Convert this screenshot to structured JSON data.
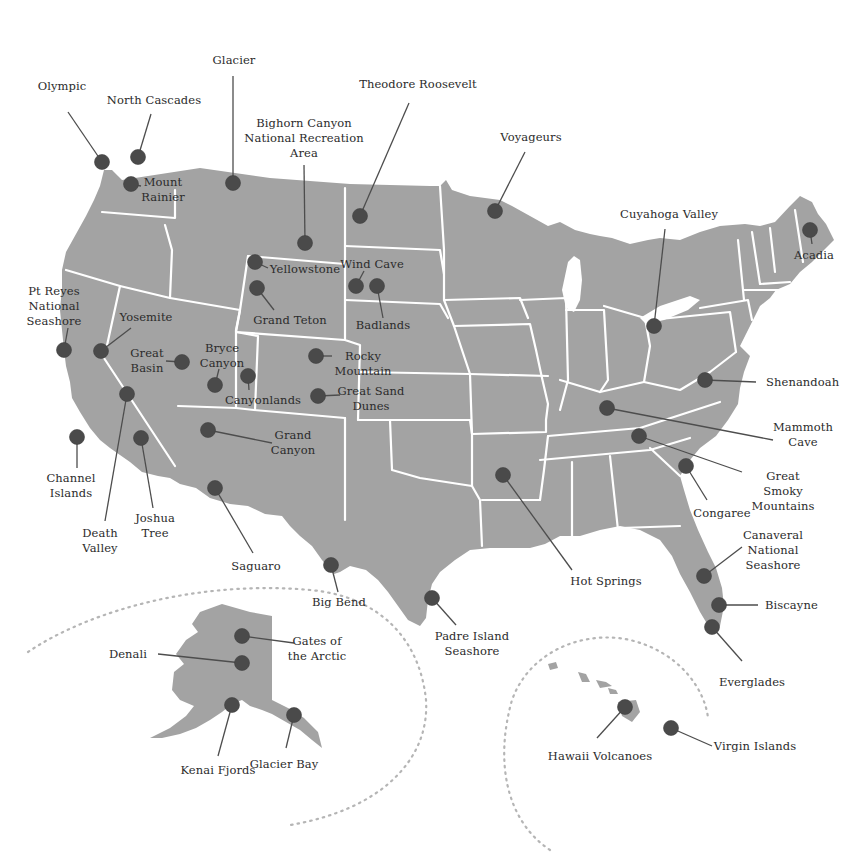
{
  "colors": {
    "land": "#a3a3a3",
    "border": "#ffffff",
    "marker": "#4a4a4a",
    "leader": "#4d4d4d",
    "text": "#2b2b2b",
    "inset_ring": "#b5b5b5"
  },
  "regions": {
    "contiguous_us": "Contiguous United States",
    "alaska_inset": "Alaska",
    "hawaii_inset": "Hawaii"
  },
  "parks": [
    {
      "id": "olympic",
      "name": "Olympic"
    },
    {
      "id": "north-cascades",
      "name": "North Cascades"
    },
    {
      "id": "mount-rainier",
      "name": "Mount\nRainier"
    },
    {
      "id": "glacier",
      "name": "Glacier"
    },
    {
      "id": "bighorn-canyon",
      "name": "Bighorn Canyon\nNational Recreation\nArea"
    },
    {
      "id": "theodore-roosevelt",
      "name": "Theodore Roosevelt"
    },
    {
      "id": "voyageurs",
      "name": "Voyageurs"
    },
    {
      "id": "cuyahoga-valley",
      "name": "Cuyahoga Valley"
    },
    {
      "id": "acadia",
      "name": "Acadia"
    },
    {
      "id": "yellowstone",
      "name": "Yellowstone"
    },
    {
      "id": "wind-cave",
      "name": "Wind Cave"
    },
    {
      "id": "badlands",
      "name": "Badlands"
    },
    {
      "id": "grand-teton",
      "name": "Grand Teton"
    },
    {
      "id": "pt-reyes",
      "name": "Pt Reyes\nNational\nSeashore"
    },
    {
      "id": "yosemite",
      "name": "Yosemite"
    },
    {
      "id": "great-basin",
      "name": "Great\nBasin"
    },
    {
      "id": "bryce-canyon",
      "name": "Bryce\nCanyon"
    },
    {
      "id": "canyonlands",
      "name": "Canyonlands"
    },
    {
      "id": "rocky-mountain",
      "name": "Rocky\nMountain"
    },
    {
      "id": "great-sand-dunes",
      "name": "Great Sand\nDunes"
    },
    {
      "id": "shenandoah",
      "name": "Shenandoah"
    },
    {
      "id": "mammoth-cave",
      "name": "Mammoth\nCave"
    },
    {
      "id": "great-smoky-mountains",
      "name": "Great Smoky\nMountains"
    },
    {
      "id": "congaree",
      "name": "Congaree"
    },
    {
      "id": "channel-islands",
      "name": "Channel\nIslands"
    },
    {
      "id": "death-valley",
      "name": "Death\nValley"
    },
    {
      "id": "joshua-tree",
      "name": "Joshua\nTree"
    },
    {
      "id": "grand-canyon",
      "name": "Grand\nCanyon"
    },
    {
      "id": "saguaro",
      "name": "Saguaro"
    },
    {
      "id": "big-bend",
      "name": "Big Bend"
    },
    {
      "id": "hot-springs",
      "name": "Hot Springs"
    },
    {
      "id": "padre-island",
      "name": "Padre Island\nSeashore"
    },
    {
      "id": "canaveral",
      "name": "Canaveral\nNational\nSeashore"
    },
    {
      "id": "biscayne",
      "name": "Biscayne"
    },
    {
      "id": "everglades",
      "name": "Everglades"
    },
    {
      "id": "denali",
      "name": "Denali"
    },
    {
      "id": "gates-of-the-arctic",
      "name": "Gates of\nthe Arctic"
    },
    {
      "id": "kenai-fjords",
      "name": "Kenai Fjords"
    },
    {
      "id": "glacier-bay",
      "name": "Glacier Bay"
    },
    {
      "id": "hawaii-volcanoes",
      "name": "Hawaii Volcanoes"
    },
    {
      "id": "virgin-islands",
      "name": "Virgin Islands"
    }
  ]
}
